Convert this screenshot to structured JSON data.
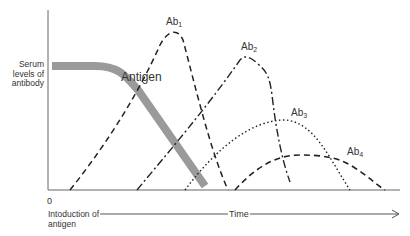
{
  "diagram": {
    "y_axis_label": "Serum levels of antibody",
    "origin_label": "0",
    "x_axis_start_label": "Intoduction of antigen",
    "x_axis_label": "Time",
    "antigen_label": "Antigen",
    "curves": [
      {
        "name": "Ab",
        "sub": "1",
        "style": "dashed"
      },
      {
        "name": "Ab",
        "sub": "2",
        "style": "dash-dot"
      },
      {
        "name": "Ab",
        "sub": "3",
        "style": "dotted"
      },
      {
        "name": "Ab",
        "sub": "4",
        "style": "dashed"
      }
    ],
    "colors": {
      "antigen": "#9a9a9a",
      "lines": "#222222",
      "axis": "#555555"
    }
  }
}
